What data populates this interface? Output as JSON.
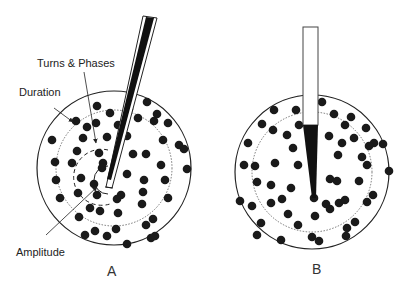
{
  "figure": {
    "panel_a": {
      "label": "A",
      "annotations": {
        "turns_phases": "Turns & Phases",
        "duration": "Duration",
        "amplitude": "Amplitude"
      },
      "electrode": "concentric needle (inclined)"
    },
    "panel_b": {
      "label": "B",
      "electrode": "monopolar needle (vertical)"
    },
    "colors": {
      "ink": "#111111",
      "fiber_dot": "#1a1a1a",
      "background": "#ffffff"
    }
  }
}
